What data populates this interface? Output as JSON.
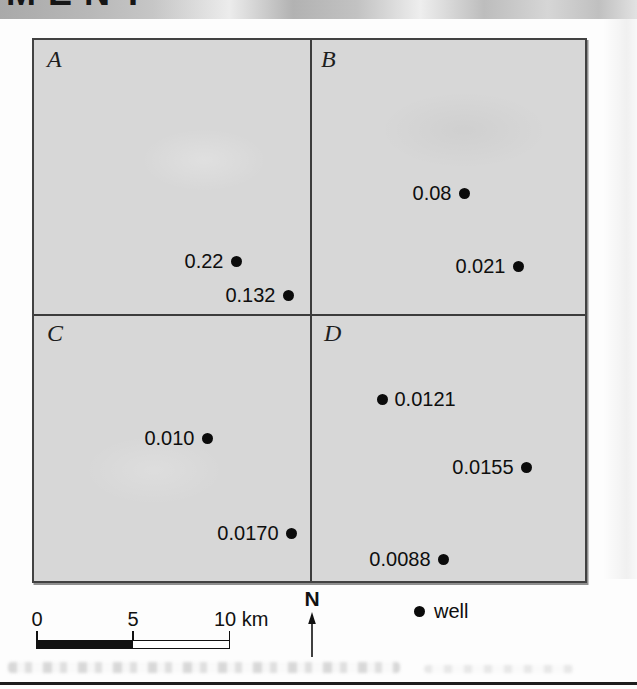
{
  "page": {
    "header_fragment": "MENT"
  },
  "map": {
    "quadrants": [
      {
        "label": "A"
      },
      {
        "label": "B"
      },
      {
        "label": "C"
      },
      {
        "label": "D"
      }
    ],
    "wells": [
      {
        "quadrant": "A",
        "value": "0.22",
        "label_side": "left"
      },
      {
        "quadrant": "A",
        "value": "0.132",
        "label_side": "left"
      },
      {
        "quadrant": "B",
        "value": "0.08",
        "label_side": "left"
      },
      {
        "quadrant": "B",
        "value": "0.021",
        "label_side": "left"
      },
      {
        "quadrant": "C",
        "value": "0.010",
        "label_side": "left"
      },
      {
        "quadrant": "C",
        "value": "0.0170",
        "label_side": "left"
      },
      {
        "quadrant": "D",
        "value": "0.0121",
        "label_side": "right"
      },
      {
        "quadrant": "D",
        "value": "0.0155",
        "label_side": "left"
      },
      {
        "quadrant": "D",
        "value": "0.0088",
        "label_side": "left"
      }
    ]
  },
  "scale_bar": {
    "labels": [
      "0",
      "5",
      "10 km"
    ],
    "km_extent": 10
  },
  "north_arrow": {
    "label": "N"
  },
  "legend": {
    "label": "well"
  },
  "colors": {
    "map_fill": "#d7d7d7",
    "ink": "#111111",
    "scan_band_gray": "#b3b3b3"
  }
}
